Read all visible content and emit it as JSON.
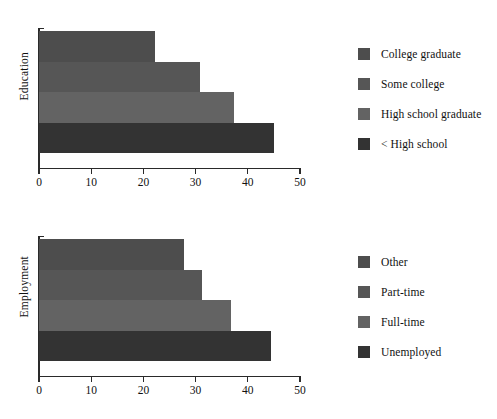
{
  "chart_data": [
    {
      "type": "bar",
      "orientation": "horizontal",
      "id": "education",
      "title": "",
      "ylabel": "Education",
      "xlabel": "",
      "xlim": [
        0,
        50
      ],
      "xticks": [
        0,
        10,
        20,
        30,
        40,
        50
      ],
      "xtick_labels": [
        "0",
        "10",
        "20",
        "30",
        "40",
        "50"
      ],
      "grid": false,
      "legend_position": "right",
      "categories": [
        "College graduate",
        "Some college",
        "High school graduate",
        "< High school"
      ],
      "values": [
        22.3,
        30.8,
        37.4,
        45.0
      ],
      "colors": [
        "#4d4d4d",
        "#565656",
        "#636363",
        "#333333"
      ],
      "series": [
        {
          "name": "College graduate",
          "value": 22.3,
          "color": "#4d4d4d"
        },
        {
          "name": "Some college",
          "value": 30.8,
          "color": "#565656"
        },
        {
          "name": "High school graduate",
          "value": 37.4,
          "color": "#636363"
        },
        {
          "name": "< High school",
          "value": 45.0,
          "color": "#333333"
        }
      ]
    },
    {
      "type": "bar",
      "orientation": "horizontal",
      "id": "employment",
      "title": "",
      "ylabel": "Employment",
      "xlabel": "",
      "xlim": [
        0,
        50
      ],
      "xticks": [
        0,
        10,
        20,
        30,
        40,
        50
      ],
      "xtick_labels": [
        "0",
        "10",
        "20",
        "30",
        "40",
        "50"
      ],
      "grid": false,
      "legend_position": "right",
      "categories": [
        "Other",
        "Part-time",
        "Full-time",
        "Unemployed"
      ],
      "values": [
        27.8,
        31.2,
        36.8,
        44.4
      ],
      "colors": [
        "#4d4d4d",
        "#565656",
        "#636363",
        "#333333"
      ],
      "series": [
        {
          "name": "Other",
          "value": 27.8,
          "color": "#4d4d4d"
        },
        {
          "name": "Part-time",
          "value": 31.2,
          "color": "#565656"
        },
        {
          "name": "Full-time",
          "value": 36.8,
          "color": "#636363"
        },
        {
          "name": "Unemployed",
          "value": 44.4,
          "color": "#333333"
        }
      ]
    }
  ],
  "education_panel": {
    "axis_label": "Education",
    "ticks": [
      "0",
      "10",
      "20",
      "30",
      "40",
      "50"
    ],
    "legend": [
      {
        "label": "College graduate",
        "color": "#4d4d4d"
      },
      {
        "label": "Some college",
        "color": "#565656"
      },
      {
        "label": "High school graduate",
        "color": "#636363"
      },
      {
        "label": "< High school",
        "color": "#333333"
      }
    ]
  },
  "employment_panel": {
    "axis_label": "Employment",
    "ticks": [
      "0",
      "10",
      "20",
      "30",
      "40",
      "50"
    ],
    "legend": [
      {
        "label": "Other",
        "color": "#4d4d4d"
      },
      {
        "label": "Part-time",
        "color": "#565656"
      },
      {
        "label": "Full-time",
        "color": "#636363"
      },
      {
        "label": "Unemployed",
        "color": "#333333"
      }
    ]
  }
}
